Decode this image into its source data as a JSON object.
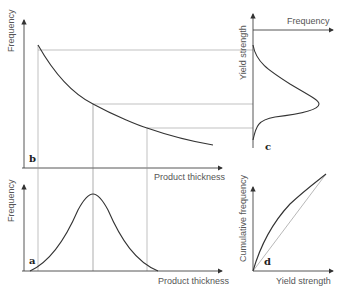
{
  "figure": {
    "panels": [
      {
        "id": "a",
        "label": "a",
        "xlabel": "Product thickness",
        "ylabel": "Frequency",
        "type": "bell-curve"
      },
      {
        "id": "b",
        "label": "b",
        "xlabel": "Product thickness",
        "ylabel": "Frequency",
        "type": "decreasing-curve"
      },
      {
        "id": "c",
        "label": "c",
        "xlabel": "Frequency",
        "ylabel": "Yield strength",
        "type": "skewed-distribution"
      },
      {
        "id": "d",
        "label": "d",
        "xlabel": "Yield strength",
        "ylabel": "Cumulative frequency",
        "type": "cumulative-curves"
      }
    ]
  },
  "colors": {
    "line": "#333333",
    "guide": "#999999",
    "text": "#555555"
  }
}
